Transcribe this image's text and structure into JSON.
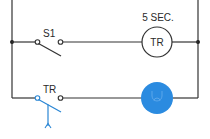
{
  "diagram": {
    "type": "ladder-logic",
    "colors": {
      "wire": "#333333",
      "accent": "#2a86d4",
      "lamp_fill": "#2b8be0"
    },
    "rungs": [
      {
        "id": "rung-1",
        "contact": {
          "label": "S1",
          "type": "normally-open"
        },
        "output": {
          "label": "TR",
          "type": "timer-coil",
          "setting": "5 SEC."
        }
      },
      {
        "id": "rung-2",
        "contact": {
          "label": "TR",
          "type": "timed-contact"
        },
        "output": {
          "label": "",
          "type": "lamp",
          "icon": "lamp-icon"
        }
      }
    ]
  }
}
